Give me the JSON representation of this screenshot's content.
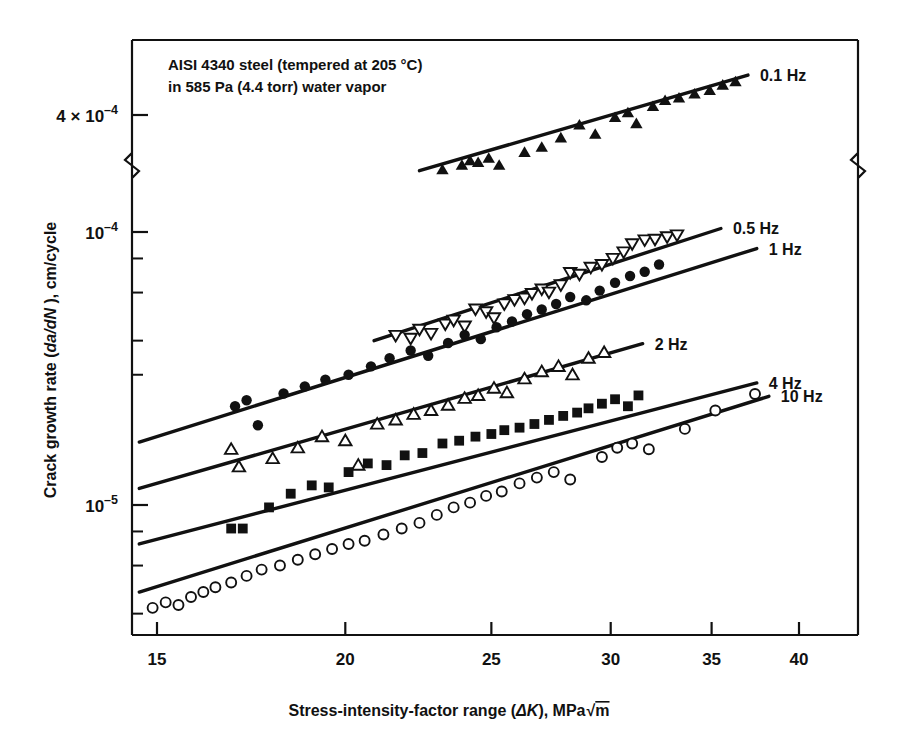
{
  "figure": {
    "annotation_line1": "AISI 4340 steel (tempered at 205 °C)",
    "annotation_line2": "in 585 Pa (4.4 torr) water vapor",
    "xlabel_pre": "Stress-intensity-factor range (",
    "xlabel_sym": "ΔK",
    "xlabel_post": "), MPa",
    "xlabel_unit": "m",
    "ylabel": "Crack growth rate (da/dN ), cm/cycle",
    "ylabel_pre": "Crack growth rate (",
    "ylabel_sym": "da/dN",
    "ylabel_post": " ), cm/cycle"
  },
  "axes": {
    "x_ticks": [
      "15",
      "20",
      "25",
      "30",
      "35",
      "40"
    ],
    "x_tick_values": [
      15,
      20,
      25,
      30,
      35,
      40
    ],
    "x_range": [
      14.2,
      43.0
    ],
    "x_scale": "log",
    "y_scale": "log",
    "y_axis_break": true,
    "y_tick_labels": [
      {
        "text_mantissa": "4 × 10",
        "text_exp": "–4",
        "value": 0.0004
      },
      {
        "text_mantissa": "10",
        "text_exp": "–4",
        "value": 0.0001
      },
      {
        "text_mantissa": "10",
        "text_exp": "–5",
        "value": 1e-05
      }
    ],
    "y_minor_values": [
      8e-05,
      6e-05,
      4e-05,
      3e-05,
      8e-06,
      6e-06,
      4e-06
    ],
    "y_range_lower": [
      3.4e-06,
      0.000128
    ],
    "y_range_upper": [
      0.00026,
      0.00058
    ]
  },
  "legend": {
    "entries": [
      {
        "label": "0.1 Hz",
        "marker": "filled-triangle-up"
      },
      {
        "label": "0.5 Hz",
        "marker": "open-triangle-down"
      },
      {
        "label": "1 Hz",
        "marker": "filled-circle"
      },
      {
        "label": "2 Hz",
        "marker": "open-triangle-up"
      },
      {
        "label": "4 Hz",
        "marker": "filled-square"
      },
      {
        "label": "10 Hz",
        "marker": "open-circle"
      }
    ]
  },
  "chart_data": {
    "type": "scatter",
    "xlabel": "Stress-intensity-factor range (ΔK), MPa√m",
    "ylabel": "Crack growth rate (da/dN), cm/cycle",
    "xscale": "log",
    "yscale": "log",
    "xlim": [
      14.2,
      43.0
    ],
    "grid": false,
    "legend_position": "right-inline",
    "annotations": [
      "AISI 4340 steel (tempered at 205 °C)",
      "in 585 Pa (4.4 torr) water vapor"
    ],
    "series": [
      {
        "name": "0.1 Hz",
        "marker": "filled-triangle-up",
        "fit_line": {
          "x": [
            22.4,
            37.0
          ],
          "y": [
            0.00025,
            0.00056
          ]
        },
        "points": [
          [
            23.2,
            0.000252
          ],
          [
            23.9,
            0.000262
          ],
          [
            24.2,
            0.000272
          ],
          [
            24.5,
            0.000268
          ],
          [
            24.9,
            0.000278
          ],
          [
            25.3,
            0.000262
          ],
          [
            26.3,
            0.000292
          ],
          [
            27.0,
            0.000305
          ],
          [
            27.8,
            0.00033
          ],
          [
            28.6,
            0.000368
          ],
          [
            29.3,
            0.00034
          ],
          [
            30.2,
            0.000392
          ],
          [
            30.8,
            0.000408
          ],
          [
            31.2,
            0.000372
          ],
          [
            32.0,
            0.00043
          ],
          [
            32.6,
            0.000452
          ],
          [
            33.3,
            0.000462
          ],
          [
            34.1,
            0.000478
          ],
          [
            34.9,
            0.000492
          ],
          [
            35.6,
            0.000515
          ],
          [
            36.3,
            0.00053
          ]
        ]
      },
      {
        "name": "0.5 Hz",
        "marker": "open-triangle-down",
        "fit_line": {
          "x": [
            20.9,
            35.5
          ],
          "y": [
            4e-05,
            0.000103
          ]
        },
        "points": [
          [
            21.6,
            4.18e-05
          ],
          [
            22.1,
            4.08e-05
          ],
          [
            22.4,
            4.4e-05
          ],
          [
            22.8,
            4.25e-05
          ],
          [
            23.3,
            4.6e-05
          ],
          [
            23.6,
            4.75e-05
          ],
          [
            24.0,
            4.52e-05
          ],
          [
            24.4,
            5.22e-05
          ],
          [
            24.8,
            5.1e-05
          ],
          [
            25.1,
            4.85e-05
          ],
          [
            25.5,
            5.45e-05
          ],
          [
            25.9,
            5.65e-05
          ],
          [
            26.3,
            5.72e-05
          ],
          [
            26.6,
            5.95e-05
          ],
          [
            27.0,
            6.18e-05
          ],
          [
            27.3,
            6.02e-05
          ],
          [
            27.8,
            6.4e-05
          ],
          [
            28.2,
            7.1e-05
          ],
          [
            28.6,
            7e-05
          ],
          [
            29.1,
            7.42e-05
          ],
          [
            29.6,
            7.6e-05
          ],
          [
            30.1,
            8e-05
          ],
          [
            30.6,
            8.45e-05
          ],
          [
            31.0,
            9.05e-05
          ],
          [
            31.6,
            9.35e-05
          ],
          [
            32.1,
            9.4e-05
          ],
          [
            32.7,
            9.6e-05
          ],
          [
            33.2,
            9.75e-05
          ]
        ]
      },
      {
        "name": "1 Hz",
        "marker": "filled-circle",
        "fit_line": {
          "x": [
            14.6,
            37.5
          ],
          "y": [
            1.7e-05,
            8.7e-05
          ]
        },
        "points": [
          [
            16.9,
            2.3e-05
          ],
          [
            17.2,
            2.42e-05
          ],
          [
            17.5,
            1.96e-05
          ],
          [
            18.2,
            2.56e-05
          ],
          [
            18.8,
            2.72e-05
          ],
          [
            19.4,
            2.88e-05
          ],
          [
            20.1,
            3e-05
          ],
          [
            20.8,
            3.22e-05
          ],
          [
            21.4,
            3.45e-05
          ],
          [
            22.1,
            3.68e-05
          ],
          [
            22.7,
            3.52e-05
          ],
          [
            23.4,
            3.92e-05
          ],
          [
            24.0,
            4.2e-05
          ],
          [
            24.6,
            4.05e-05
          ],
          [
            25.2,
            4.48e-05
          ],
          [
            25.8,
            4.7e-05
          ],
          [
            26.4,
            5e-05
          ],
          [
            27.0,
            5.2e-05
          ],
          [
            27.6,
            5.45e-05
          ],
          [
            28.2,
            5.78e-05
          ],
          [
            28.9,
            5.62e-05
          ],
          [
            29.5,
            6.1e-05
          ],
          [
            30.2,
            6.52e-05
          ],
          [
            30.9,
            6.9e-05
          ],
          [
            31.6,
            7.15e-05
          ],
          [
            32.3,
            7.6e-05
          ]
        ]
      },
      {
        "name": "2 Hz",
        "marker": "open-triangle-up",
        "fit_line": {
          "x": [
            14.6,
            31.5
          ],
          "y": [
            1.15e-05,
            3.9e-05
          ]
        },
        "points": [
          [
            16.8,
            1.6e-05
          ],
          [
            17.0,
            1.38e-05
          ],
          [
            17.9,
            1.48e-05
          ],
          [
            18.6,
            1.62e-05
          ],
          [
            19.3,
            1.78e-05
          ],
          [
            20.0,
            1.72e-05
          ],
          [
            20.4,
            1.4e-05
          ],
          [
            21.0,
            1.98e-05
          ],
          [
            21.6,
            2.05e-05
          ],
          [
            22.2,
            2.15e-05
          ],
          [
            22.8,
            2.22e-05
          ],
          [
            23.4,
            2.32e-05
          ],
          [
            24.0,
            2.46e-05
          ],
          [
            24.5,
            2.52e-05
          ],
          [
            25.1,
            2.68e-05
          ],
          [
            25.6,
            2.58e-05
          ],
          [
            26.3,
            2.9e-05
          ],
          [
            27.0,
            3.08e-05
          ],
          [
            27.7,
            3.22e-05
          ],
          [
            28.3,
            3e-05
          ],
          [
            29.0,
            3.45e-05
          ],
          [
            29.7,
            3.62e-05
          ]
        ]
      },
      {
        "name": "4 Hz",
        "marker": "filled-square",
        "fit_line": {
          "x": [
            14.6,
            37.5
          ],
          "y": [
            7.2e-06,
            2.8e-05
          ]
        },
        "points": [
          [
            16.8,
            8.2e-06
          ],
          [
            17.1,
            8.2e-06
          ],
          [
            17.8,
            9.8e-06
          ],
          [
            18.4,
            1.1e-05
          ],
          [
            19.0,
            1.18e-05
          ],
          [
            19.5,
            1.16e-05
          ],
          [
            20.1,
            1.32e-05
          ],
          [
            20.7,
            1.42e-05
          ],
          [
            21.3,
            1.4e-05
          ],
          [
            21.9,
            1.52e-05
          ],
          [
            22.5,
            1.55e-05
          ],
          [
            23.2,
            1.68e-05
          ],
          [
            23.8,
            1.72e-05
          ],
          [
            24.4,
            1.78e-05
          ],
          [
            25.0,
            1.82e-05
          ],
          [
            25.5,
            1.88e-05
          ],
          [
            26.1,
            1.92e-05
          ],
          [
            26.7,
            1.98e-05
          ],
          [
            27.3,
            2.05e-05
          ],
          [
            27.9,
            2.12e-05
          ],
          [
            28.5,
            2.18e-05
          ],
          [
            29.0,
            2.26e-05
          ],
          [
            29.6,
            2.35e-05
          ],
          [
            30.2,
            2.44e-05
          ],
          [
            30.8,
            2.3e-05
          ],
          [
            31.3,
            2.52e-05
          ]
        ]
      },
      {
        "name": "10 Hz",
        "marker": "open-circle",
        "fit_line": {
          "x": [
            14.6,
            38.2
          ],
          "y": [
            4.8e-06,
            2.5e-05
          ]
        },
        "points": [
          [
            14.9,
            4.2e-06
          ],
          [
            15.2,
            4.4e-06
          ],
          [
            15.5,
            4.3e-06
          ],
          [
            15.8,
            4.6e-06
          ],
          [
            16.1,
            4.8e-06
          ],
          [
            16.4,
            5e-06
          ],
          [
            16.8,
            5.2e-06
          ],
          [
            17.2,
            5.5e-06
          ],
          [
            17.6,
            5.8e-06
          ],
          [
            18.1,
            6e-06
          ],
          [
            18.6,
            6.3e-06
          ],
          [
            19.1,
            6.6e-06
          ],
          [
            19.6,
            6.9e-06
          ],
          [
            20.1,
            7.2e-06
          ],
          [
            20.6,
            7.4e-06
          ],
          [
            21.2,
            7.8e-06
          ],
          [
            21.8,
            8.2e-06
          ],
          [
            22.4,
            8.6e-06
          ],
          [
            23.0,
            9.2e-06
          ],
          [
            23.6,
            9.8e-06
          ],
          [
            24.2,
            1.02e-05
          ],
          [
            24.8,
            1.08e-05
          ],
          [
            25.4,
            1.12e-05
          ],
          [
            26.1,
            1.2e-05
          ],
          [
            26.8,
            1.26e-05
          ],
          [
            27.5,
            1.32e-05
          ],
          [
            28.2,
            1.24e-05
          ],
          [
            29.6,
            1.5e-05
          ],
          [
            30.3,
            1.62e-05
          ],
          [
            31.0,
            1.68e-05
          ],
          [
            31.8,
            1.6e-05
          ],
          [
            33.6,
            1.9e-05
          ],
          [
            35.2,
            2.22e-05
          ],
          [
            37.4,
            2.55e-05
          ]
        ]
      }
    ]
  }
}
